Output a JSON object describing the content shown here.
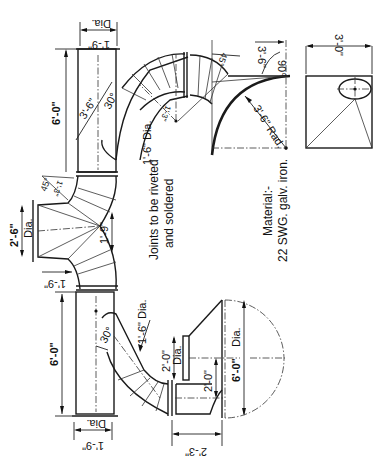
{
  "drawing": {
    "title": "Galvanised iron ducting assembly (rotated 90°)",
    "notes": {
      "joints_line1": "Joints to be riveted",
      "joints_line2": "and soldered",
      "material_line1": "Material:-",
      "material_line2": "22 SWG. galv. iron."
    },
    "dimensions": {
      "top_pipe_dia": "1'-9\"",
      "top_pipe_dia_label": "Dia.",
      "top_pipe_length": "6'-0\"",
      "top_branch_length": "3'-6\"",
      "top_branch_angle": "30°",
      "top_branch_dia": "1'-6\" Dia.",
      "top_bend_radius": "1'-3\"",
      "bend_45": "45°",
      "bend_radius_small": "1'-3\"",
      "bend_90": "90°",
      "large_radius": "3'-6\" Rad.",
      "large_radius_top": "3'-6\"",
      "square_side": "3'-0\"",
      "middle_dia": "2'-6\"",
      "middle_dia_label": "Dia.",
      "middle_inner": "1'-9\"",
      "middle_lower": "1'-9\"",
      "bottom_pipe_length": "6'-0\"",
      "bottom_branch_angle": "30°",
      "bottom_branch_dia": "1'-6\" Dia.",
      "bottom_pipe_dia": "1'-9\"",
      "bottom_pipe_dia_label": "Dia.",
      "hood_neck_dia": "2'-0\"",
      "hood_neck_dia_label": "Dia.",
      "hood_depth": "2'-0\"",
      "hood_dia": "6'-0\"",
      "hood_dia_label": "Dia.",
      "hood_length": "2'-3\""
    }
  }
}
